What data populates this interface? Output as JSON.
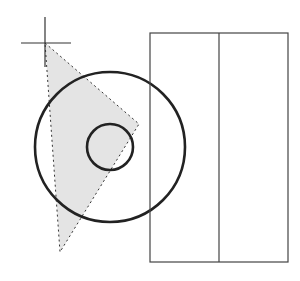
{
  "canvas": {
    "width": 300,
    "height": 281,
    "background": "#ffffff"
  },
  "colors": {
    "stroke": "#222222",
    "rect_stroke": "#444444",
    "fill": "#e4e4e4",
    "dash": "#333333"
  },
  "crosshair": {
    "x": 45,
    "y": 43,
    "arm_left": 24,
    "arm_right": 26,
    "arm_up": 26,
    "arm_down": 24
  },
  "triangle": {
    "points": "45,43 139,124 60,252"
  },
  "outer_circle": {
    "cx": 110,
    "cy": 147,
    "r": 75
  },
  "inner_circle": {
    "cx": 110,
    "cy": 147,
    "r": 23
  },
  "rectangle": {
    "x": 150,
    "y": 33,
    "width": 138,
    "height": 229,
    "divider_x": 219
  }
}
